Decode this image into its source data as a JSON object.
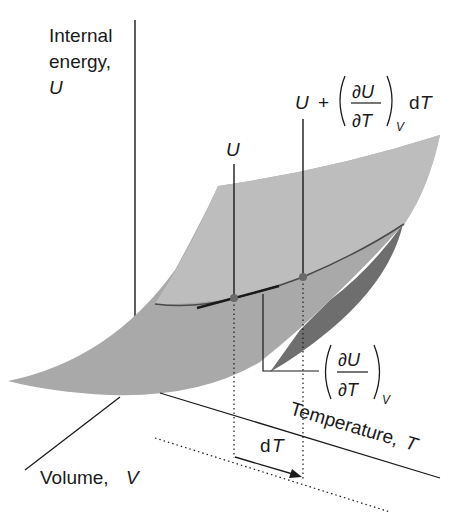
{
  "diagram": {
    "type": "3d-surface-schematic",
    "colors": {
      "surface_top": "#a8a8a8",
      "surface_far": "#c9c9c9",
      "surface_under": "#6e6e6e",
      "curve": "#4a4a4a",
      "line": "#1a1a1a",
      "point": "#6a6a6a",
      "background": "#ffffff"
    },
    "axes": {
      "u_axis": {
        "line1": "Internal",
        "line2": "energy,",
        "symbol": "U"
      },
      "volume_axis": {
        "label": "Volume, ",
        "symbol": "V"
      },
      "temperature_axis": {
        "label": "Temperature, ",
        "symbol": "T"
      }
    },
    "annotations": {
      "point_u": {
        "symbol": "U"
      },
      "point_u_plus": {
        "prefix": "U",
        "plus": "+",
        "numerator": "∂U",
        "denominator": "∂T",
        "subscript": "V",
        "suffix_d": "d",
        "suffix_t": "T"
      },
      "slope": {
        "numerator": "∂U",
        "denominator": "∂T",
        "subscript": "V"
      },
      "increment": {
        "d": "d",
        "t": "T"
      }
    }
  }
}
